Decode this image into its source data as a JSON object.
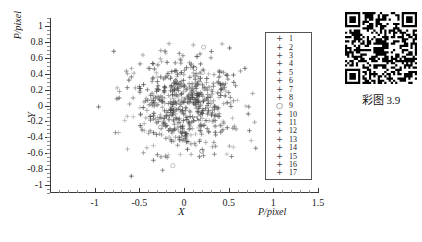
{
  "chart_data": {
    "type": "scatter",
    "title": "",
    "xlabel": "X",
    "ylabel": "Y",
    "x_axis_unit_label": "P/pixel",
    "y_axis_unit_label": "P/pixel",
    "xlim": [
      -1.5,
      1.5
    ],
    "ylim": [
      -1.1,
      1.1
    ],
    "xticks": [
      -1.5,
      -1,
      -0.5,
      0,
      0.5,
      1,
      1.5
    ],
    "xtick_labels": [
      "",
      "-1",
      "-0.5",
      "0",
      "0.5",
      "1",
      "1.5"
    ],
    "yticks": [
      -1,
      -0.8,
      -0.6,
      -0.4,
      -0.2,
      0,
      0.2,
      0.4,
      0.6,
      0.8,
      1
    ],
    "ytick_labels": [
      "-1",
      "-0.8",
      "-0.6",
      "-0.4",
      "-0.2",
      "0",
      "0.2",
      "0.4",
      "0.6",
      "0.8",
      "1"
    ],
    "grid": false,
    "legend_position": "inside-right",
    "marker_color": "#444444",
    "series": [
      {
        "name": "1",
        "marker": "plus",
        "n": 38,
        "cx": 0.02,
        "cy": 0.05,
        "sx": 0.3,
        "sy": 0.3
      },
      {
        "name": "2",
        "marker": "plus",
        "n": 36,
        "cx": -0.05,
        "cy": -0.02,
        "sx": 0.28,
        "sy": 0.3
      },
      {
        "name": "3",
        "marker": "plus",
        "n": 40,
        "cx": 0.06,
        "cy": -0.08,
        "sx": 0.31,
        "sy": 0.28
      },
      {
        "name": "4",
        "marker": "plus",
        "n": 35,
        "cx": -0.08,
        "cy": 0.1,
        "sx": 0.29,
        "sy": 0.27
      },
      {
        "name": "5",
        "marker": "plus",
        "n": 37,
        "cx": 0.1,
        "cy": 0.02,
        "sx": 0.27,
        "sy": 0.31
      },
      {
        "name": "6",
        "marker": "plus",
        "n": 34,
        "cx": -0.02,
        "cy": -0.12,
        "sx": 0.3,
        "sy": 0.26
      },
      {
        "name": "7",
        "marker": "plus",
        "n": 39,
        "cx": 0.04,
        "cy": 0.08,
        "sx": 0.32,
        "sy": 0.29
      },
      {
        "name": "8",
        "marker": "plus",
        "n": 33,
        "cx": -0.1,
        "cy": 0.0,
        "sx": 0.26,
        "sy": 0.3
      },
      {
        "name": "9",
        "marker": "circle",
        "n": 22,
        "cx": 0.0,
        "cy": -0.04,
        "sx": 0.34,
        "sy": 0.32
      },
      {
        "name": "10",
        "marker": "plus",
        "n": 38,
        "cx": 0.08,
        "cy": -0.06,
        "sx": 0.29,
        "sy": 0.28
      },
      {
        "name": "11",
        "marker": "plus",
        "n": 36,
        "cx": -0.04,
        "cy": 0.06,
        "sx": 0.31,
        "sy": 0.3
      },
      {
        "name": "12",
        "marker": "plus",
        "n": 35,
        "cx": 0.02,
        "cy": -0.1,
        "sx": 0.28,
        "sy": 0.27
      },
      {
        "name": "13",
        "marker": "plus",
        "n": 37,
        "cx": -0.06,
        "cy": 0.04,
        "sx": 0.3,
        "sy": 0.29
      },
      {
        "name": "14",
        "marker": "plus",
        "n": 34,
        "cx": 0.12,
        "cy": 0.0,
        "sx": 0.27,
        "sy": 0.31
      },
      {
        "name": "15",
        "marker": "plus",
        "n": 36,
        "cx": -0.02,
        "cy": -0.14,
        "sx": 0.32,
        "sy": 0.26
      },
      {
        "name": "16",
        "marker": "plus",
        "n": 33,
        "cx": 0.05,
        "cy": 0.12,
        "sx": 0.29,
        "sy": 0.28
      },
      {
        "name": "17",
        "marker": "plus",
        "n": 35,
        "cx": -0.07,
        "cy": -0.03,
        "sx": 0.3,
        "sy": 0.3
      }
    ]
  },
  "legend": {
    "entries": [
      {
        "marker": "+",
        "label": "1"
      },
      {
        "marker": "+",
        "label": "2"
      },
      {
        "marker": "+",
        "label": "3"
      },
      {
        "marker": "+",
        "label": "4"
      },
      {
        "marker": "+",
        "label": "5"
      },
      {
        "marker": "+",
        "label": "6"
      },
      {
        "marker": "+",
        "label": "7"
      },
      {
        "marker": "+",
        "label": "8"
      },
      {
        "marker": "○",
        "label": "9"
      },
      {
        "marker": "+",
        "label": "10"
      },
      {
        "marker": "+",
        "label": "11"
      },
      {
        "marker": "+",
        "label": "12"
      },
      {
        "marker": "+",
        "label": "13"
      },
      {
        "marker": "+",
        "label": "14"
      },
      {
        "marker": "+",
        "label": "15"
      },
      {
        "marker": "+",
        "label": "16"
      },
      {
        "marker": "+",
        "label": "17"
      }
    ]
  },
  "qr": {
    "caption": "彩图 3.9",
    "icon": "qr-code-icon"
  },
  "bottom_caption": {
    "text": ""
  }
}
